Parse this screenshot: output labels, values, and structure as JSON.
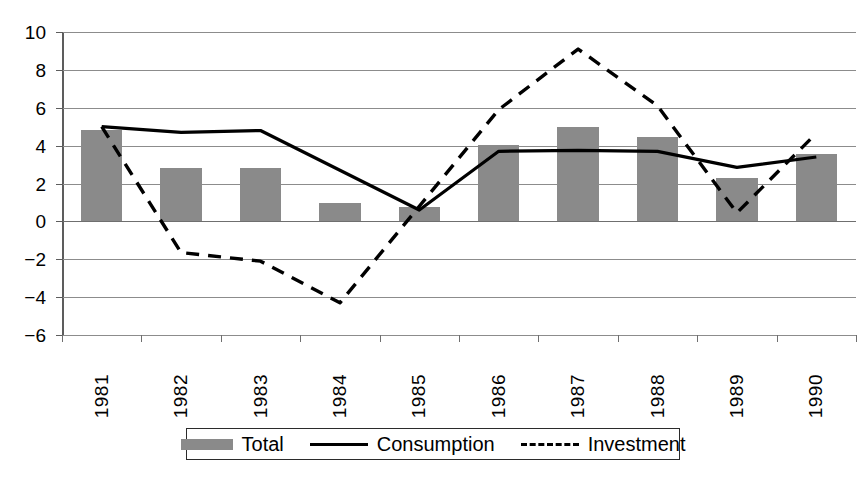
{
  "chart_data": {
    "type": "bar",
    "title": "",
    "subtitle": "",
    "xlabel": "",
    "ylabel": "",
    "grid": true,
    "legend_position": "bottom",
    "ylim": [
      -6,
      10
    ],
    "ytick_step": 2,
    "ytick_labels": [
      "10",
      "8",
      "6",
      "4",
      "2",
      "0",
      "−2",
      "−4",
      "−6"
    ],
    "ytick_values": [
      10,
      8,
      6,
      4,
      2,
      0,
      -2,
      -4,
      -6
    ],
    "categories": [
      "1981",
      "1982",
      "1983",
      "1984",
      "1985",
      "1986",
      "1987",
      "1988",
      "1989",
      "1990"
    ],
    "series": [
      {
        "name": "Total",
        "render": "bar",
        "color": "#8a8a8a",
        "values": [
          4.8,
          2.8,
          2.8,
          0.95,
          0.75,
          4.05,
          5.0,
          4.45,
          2.3,
          3.55
        ]
      },
      {
        "name": "Consumption",
        "render": "line-solid",
        "color": "#000000",
        "values": [
          5.0,
          4.7,
          4.8,
          2.7,
          0.6,
          3.7,
          3.75,
          3.7,
          2.85,
          3.4
        ]
      },
      {
        "name": "Investment",
        "render": "line-dashed",
        "color": "#000000",
        "values": [
          5.0,
          -1.65,
          -2.1,
          -4.3,
          0.8,
          5.9,
          9.1,
          6.1,
          0.45,
          4.65
        ]
      }
    ]
  },
  "legend": {
    "entries": [
      {
        "label": "Total",
        "marker": "bar-swatch-icon"
      },
      {
        "label": "Consumption",
        "marker": "solid-line-icon"
      },
      {
        "label": "Investment",
        "marker": "dashed-line-icon"
      }
    ]
  }
}
